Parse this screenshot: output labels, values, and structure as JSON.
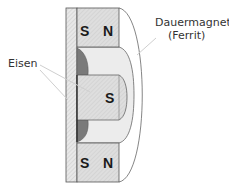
{
  "diagram": {
    "labels": {
      "magnet_line1": "Dauermagnet",
      "magnet_line2": "(Ferrit)",
      "iron": "Eisen"
    },
    "top_magnet": {
      "left_pole": "S",
      "right_pole": "N"
    },
    "bottom_magnet": {
      "left_pole": "S",
      "right_pole": "N"
    },
    "center_pole": "S",
    "colors": {
      "iron_fill": "#e4e4e4",
      "magnet_fill": "#dcdcdc",
      "ferrite_fill": "#eeeeee",
      "dark_lens": "#777777",
      "outline": "#555555",
      "leader": "#cccccc"
    }
  }
}
